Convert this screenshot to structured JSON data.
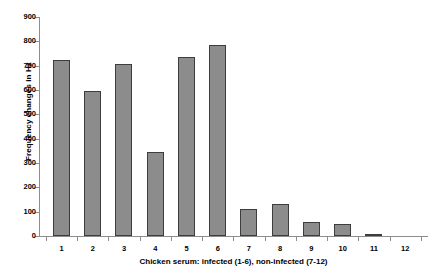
{
  "chart_data": {
    "type": "bar",
    "title": "",
    "subtitle": "",
    "xlabel": "Chicken serum: infected (1-6), non-infected (7-12)",
    "ylabel": "Frequency changes in Hz",
    "categories": [
      "1",
      "2",
      "3",
      "4",
      "5",
      "6",
      "7",
      "8",
      "9",
      "10",
      "11",
      "12"
    ],
    "values": [
      722,
      595,
      705,
      345,
      735,
      785,
      112,
      130,
      58,
      50,
      7,
      0
    ],
    "ylim": [
      0,
      900
    ],
    "yticks": [
      0,
      100,
      200,
      300,
      400,
      500,
      600,
      700,
      800,
      900
    ],
    "ytick_labels": [
      "0",
      "100",
      "200",
      "300",
      "400",
      "500",
      "600",
      "700",
      "800",
      "900"
    ],
    "grid": false,
    "legend": false,
    "legend_position": "none",
    "bar_color": "#8c8c8c",
    "bar_edge_color": "#3d3d3d",
    "axis_color": "#8d8d8d",
    "background_color": "#ffffff"
  }
}
